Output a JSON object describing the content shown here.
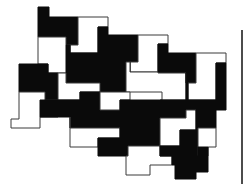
{
  "figure": {
    "colors": {
      "black": "#0a0a0a",
      "white": "#ffffff",
      "outline": "#3a3a3a",
      "rule": "#111111"
    },
    "right_rule": {
      "x": 242,
      "y1": 30,
      "y2": 184
    },
    "tiles": [
      {
        "color": "black",
        "points": "38,7 49,7 49,17 78,17 78,45 66,45 66,37 38,37"
      },
      {
        "color": "white",
        "points": "78,17 108,17 108,27 98,27 98,53 70,53 70,45 78,45"
      },
      {
        "color": "black",
        "points": "98,27 108,27 108,35 138,35 138,62 126,62 126,55 98,55"
      },
      {
        "color": "white",
        "points": "138,35 168,35 168,44 158,44 158,72 130,72 130,62 138,62"
      },
      {
        "color": "black",
        "points": "158,44 168,44 168,53 196,53 196,83 186,83 186,73 158,73"
      },
      {
        "color": "white",
        "points": "196,53 226,53 226,63 216,63 216,100 188,100 188,83 196,83"
      },
      {
        "color": "black",
        "points": "216,63 226,63 226,110 216,110"
      },
      {
        "color": "white",
        "points": "38,37 66,37 66,45 70,45 70,73 48,73 48,64 38,64"
      },
      {
        "color": "black",
        "points": "66,45 70,45 70,53 98,53 98,55 126,55 126,62 130,62 130,92 100,92 100,83 66,83"
      },
      {
        "color": "white",
        "points": "126,62 130,62 130,72 158,72 158,73 186,73 186,100 162,100 162,92 126,92"
      },
      {
        "color": "black",
        "points": "186,73 186,83 188,83 188,100 216,100 216,110 186,110 186,118 160,118 160,100 186,100"
      },
      {
        "color": "black",
        "points": "19,64 48,64 48,73 58,73 58,100 45,100 45,92 19,92"
      },
      {
        "color": "white",
        "points": "19,92 45,92 45,100 58,100 58,117 40,117 40,128 11,128 11,119 19,119"
      },
      {
        "color": "white",
        "points": "58,73 66,73 66,83 100,83 100,92 80,92 80,100 58,100"
      },
      {
        "color": "black",
        "points": "40,100 80,100 80,92 100,92 100,110 120,110 120,128 70,128 70,117 40,117"
      },
      {
        "color": "white",
        "points": "100,92 130,92 130,100 120,100 120,110 100,110"
      },
      {
        "color": "black",
        "points": "120,100 162,100 162,118 150,118 150,128 120,128"
      },
      {
        "color": "white",
        "points": "70,117 70,128 120,128 120,138 98,138 98,147 70,147"
      },
      {
        "color": "black",
        "points": "120,128 150,128 150,118 160,118 160,146 128,146 128,156 98,156 98,138 120,138"
      },
      {
        "color": "white",
        "points": "160,118 186,118 186,110 196,110 196,130 180,130 180,146 160,146"
      },
      {
        "color": "black",
        "points": "196,110 216,110 216,128 198,128 198,137 180,137 180,130 196,130"
      },
      {
        "color": "white",
        "points": "128,146 160,146 160,156 172,156 172,165 150,165 150,175 126,175 126,156 128,156"
      },
      {
        "color": "black",
        "points": "160,146 180,146 180,137 198,137 198,156 172,156 160,156"
      },
      {
        "color": "white",
        "points": "198,128 216,128 216,147 208,147 208,156 198,156"
      },
      {
        "color": "black",
        "points": "172,156 198,156 198,147 208,147 208,172 196,172 196,165 172,165"
      },
      {
        "color": "black",
        "points": "175,165 196,165 196,179 175,179"
      }
    ]
  }
}
